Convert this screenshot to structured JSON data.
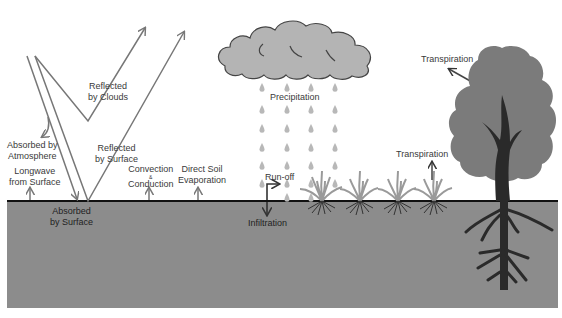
{
  "diagram": {
    "title": "",
    "colors": {
      "background": "#ffffff",
      "ground": "#8c8c8c",
      "ground_line": "#111111",
      "arrow": "#777777",
      "cloud_fill": "#b4b4b4",
      "cloud_stroke": "#444444",
      "rain": "#b8b8b8",
      "grass": "#9a9a9a",
      "tree_canopy": "#7b7b7b",
      "tree_trunk": "#2a2a2a"
    },
    "labels": {
      "reflected_clouds": [
        "Reflected",
        "by Clouds"
      ],
      "absorbed_atmosphere": [
        "Absorbed by",
        "Atmosphere"
      ],
      "reflected_surface": [
        "Reflected",
        "by Surface"
      ],
      "longwave": [
        "Longwave",
        "from Surface"
      ],
      "absorbed_surface": [
        "Absorbed",
        "by Surface"
      ],
      "convection": [
        "Convection",
        "&",
        "Conduction"
      ],
      "soil_evaporation": [
        "Direct Soil",
        "Evaporation"
      ],
      "precipitation": "Precipitation",
      "runoff": "Run-off",
      "infiltration": "Infiltration",
      "transpiration_grass": "Transpiration",
      "transpiration_tree": "Transpiration"
    },
    "elements": {
      "cloud": "cloud",
      "rain_columns": 4,
      "rain_rows": 6,
      "grass_clumps": 4,
      "tree": "tree-with-roots"
    }
  }
}
